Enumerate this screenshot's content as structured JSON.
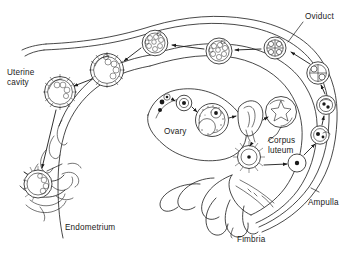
{
  "figure": {
    "type": "anatomical-line-diagram",
    "background_color": "#ffffff",
    "line_color": "#1a1a1a",
    "text_color": "#1a1a1a"
  },
  "labels": {
    "oviduct": "Oviduct",
    "uterine_cavity_line1": "Uterine",
    "uterine_cavity_line2": "cavity",
    "ovary": "Ovary",
    "corpus_luteum_line1": "Corpus",
    "corpus_luteum_line2": "luteum",
    "ampulla": "Ampulla",
    "fimbria": "Fimbria",
    "endometrium": "Endometrium"
  },
  "structures": [
    {
      "name": "oviduct",
      "label": "Oviduct",
      "description": "Fallopian tube drawn as a long double-walled curving duct sweeping from upper right down the right side"
    },
    {
      "name": "uterine-cavity",
      "label": "Uterine cavity",
      "description": "Open cavity at the upper left bounded by the endometrial wall"
    },
    {
      "name": "endometrium",
      "label": "Endometrium",
      "description": "Thickened glandular uterine lining at lower left with implantation site"
    },
    {
      "name": "ovary",
      "label": "Ovary",
      "description": "Oval organ at center showing follicular development stages"
    },
    {
      "name": "corpus-luteum",
      "label": "Corpus luteum",
      "description": "Post-ovulatory structure with stellate interior at center right"
    },
    {
      "name": "ampulla",
      "label": "Ampulla",
      "description": "Widened distal portion of the oviduct at lower right where fertilization occurs"
    },
    {
      "name": "fimbria",
      "label": "Fimbria",
      "description": "Finger-like projections at the ovarian end of the oviduct"
    }
  ],
  "developmental_stages": [
    {
      "order": 1,
      "name": "primordial-follicles",
      "location": "ovary-left",
      "description": "Small dark primordial follicles"
    },
    {
      "order": 2,
      "name": "primary-follicle",
      "location": "ovary-left",
      "description": "Growing follicle with visible oocyte"
    },
    {
      "order": 3,
      "name": "graafian-follicle",
      "location": "ovary-center",
      "description": "Mature antral follicle with stippled granulosa"
    },
    {
      "order": 4,
      "name": "ovulation",
      "location": "ovary-right",
      "description": "Follicle rupturing and releasing oocyte"
    },
    {
      "order": 5,
      "name": "corpus-luteum",
      "location": "ovary-right",
      "description": "Corpus luteum forming after ovulation"
    },
    {
      "order": 6,
      "name": "corpus-albicans",
      "location": "below-ovary",
      "description": "Degenerating corpus, radially fringed"
    },
    {
      "order": 7,
      "name": "ovum-in-ampulla",
      "location": "ampulla",
      "description": "Released ovum captured by fimbria in the ampulla"
    },
    {
      "order": 8,
      "name": "fertilization",
      "location": "ampulla-upper",
      "description": "Sperm penetrating ovum"
    },
    {
      "order": 9,
      "name": "zygote",
      "location": "oviduct-lower-right",
      "description": "Fertilized zygote with pronuclei"
    },
    {
      "order": 10,
      "name": "two-cell-stage",
      "location": "oviduct-right",
      "description": "Two-cell cleavage stage"
    },
    {
      "order": 11,
      "name": "four-cell-stage",
      "location": "oviduct-upper-right",
      "description": "Four-cell cleavage stage"
    },
    {
      "order": 12,
      "name": "morula",
      "location": "oviduct-upper-center",
      "description": "Solid ball of blastomeres"
    },
    {
      "order": 13,
      "name": "early-blastocyst",
      "location": "uterine-cavity-right",
      "description": "Blastocyst with blastocoel and inner cell mass"
    },
    {
      "order": 14,
      "name": "free-blastocyst",
      "location": "uterine-cavity-left",
      "description": "Hatched blastocyst free in uterine cavity"
    },
    {
      "order": 15,
      "name": "implanting-blastocyst",
      "location": "endometrium",
      "description": "Blastocyst implanting into the endometrium"
    }
  ],
  "flow": {
    "direction": "Counter-clockwise: ovary to fimbria to ampulla, up the oviduct, then leftward across the uterine cavity to the implantation site in the endometrium",
    "arrow_count": 14
  }
}
